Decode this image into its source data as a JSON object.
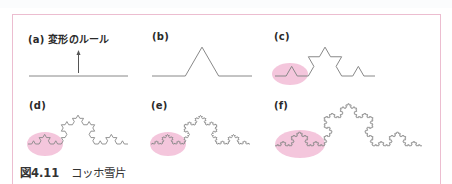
{
  "figure": {
    "caption_number": "図4.11",
    "caption_title": "コッホ雪片",
    "colors": {
      "frame_border": "#ecbdd0",
      "highlight": "#f2bcd6",
      "curve": "#888888",
      "arrow": "#555555",
      "text": "#2a2a2a"
    },
    "panels": [
      {
        "id": "a",
        "label": "(a) 変形のルール",
        "depth": 0,
        "x0": 29,
        "x1": 128,
        "y": 76,
        "highlight": false,
        "arrow": true
      },
      {
        "id": "b",
        "label": "(b)",
        "depth": 1,
        "x0": 152,
        "x1": 252,
        "y": 76,
        "highlight": false,
        "arrow": false
      },
      {
        "id": "c",
        "label": "(c)",
        "depth": 2,
        "x0": 275,
        "x1": 375,
        "y": 76,
        "highlight": true,
        "ellipse": {
          "cx": 290,
          "cy": 74,
          "rx": 18,
          "ry": 11
        }
      },
      {
        "id": "d",
        "label": "(d)",
        "depth": 3,
        "x0": 28,
        "x1": 128,
        "y": 144,
        "highlight": true,
        "ellipse": {
          "cx": 45,
          "cy": 144,
          "rx": 18,
          "ry": 12
        }
      },
      {
        "id": "e",
        "label": "(e)",
        "depth": 4,
        "x0": 151,
        "x1": 250,
        "y": 144,
        "highlight": true,
        "ellipse": {
          "cx": 168,
          "cy": 144,
          "rx": 18,
          "ry": 12
        }
      },
      {
        "id": "f",
        "label": "(f)",
        "depth": 5,
        "x0": 275,
        "x1": 422,
        "y": 146,
        "highlight": true,
        "ellipse": {
          "cx": 300,
          "cy": 144,
          "rx": 25,
          "ry": 14
        }
      }
    ]
  }
}
